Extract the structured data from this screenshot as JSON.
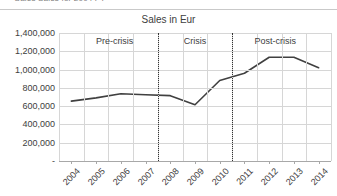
{
  "top_strip": {
    "clipped_text": "— Sales Sales for 2004 FY"
  },
  "chart_data": {
    "type": "line",
    "title": "Sales in Eur",
    "xlabel": "",
    "ylabel": "",
    "categories": [
      "2004",
      "2005",
      "2006",
      "2007",
      "2008",
      "2009",
      "2010",
      "2011",
      "2012",
      "2013",
      "2014"
    ],
    "values": [
      655000,
      690000,
      735000,
      725000,
      715000,
      615000,
      880000,
      960000,
      1135000,
      1135000,
      1020000
    ],
    "series": [
      {
        "name": "Sales in Eur",
        "values": [
          655000,
          690000,
          735000,
          725000,
          715000,
          615000,
          880000,
          960000,
          1135000,
          1135000,
          1020000
        ]
      }
    ],
    "ylim": [
      0,
      1400000
    ],
    "ytick_values": [
      0,
      200000,
      400000,
      600000,
      800000,
      1000000,
      1200000,
      1400000
    ],
    "ytick_labels": [
      "-",
      "200,000",
      "400,000",
      "600,000",
      "800,000",
      "1,000,000",
      "1,200,000",
      "1,400,000"
    ],
    "grid": true,
    "legend": false,
    "legend_position": "none",
    "line_color": "#404040",
    "grid_color": "#d6d6d6",
    "annotations": [
      {
        "text": "Pre-crisis",
        "start_category": "2004",
        "end_category": "2007",
        "center_index": 1.75
      },
      {
        "text": "Crisis",
        "start_category": "2008",
        "end_category": "2010",
        "center_index": 5.0
      },
      {
        "text": "Post-crisis",
        "start_category": "2011",
        "end_category": "2014",
        "center_index": 8.25
      }
    ],
    "dividers": [
      {
        "label": "pre-crisis/crisis boundary",
        "between": [
          "2007",
          "2008"
        ],
        "position_index": 3.5,
        "style": "dotted"
      },
      {
        "label": "crisis/post-crisis boundary",
        "between": [
          "2010",
          "2011"
        ],
        "position_index": 6.5,
        "style": "dotted"
      }
    ]
  }
}
